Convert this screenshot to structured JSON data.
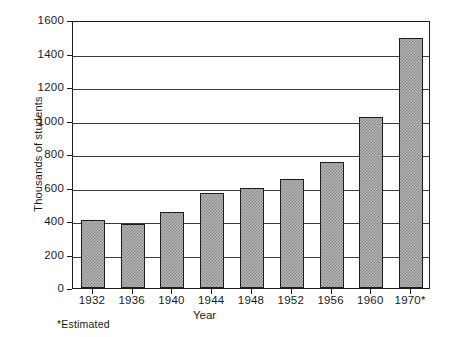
{
  "chart_data": {
    "type": "bar",
    "title": "",
    "subtitle": "",
    "xlabel": "Year",
    "ylabel": "Thousands of students",
    "categories": [
      "1932",
      "1936",
      "1940",
      "1944",
      "1948",
      "1952",
      "1956",
      "1960",
      "1970*"
    ],
    "values": [
      405,
      385,
      455,
      570,
      600,
      650,
      750,
      1020,
      1495
    ],
    "ylim": [
      0,
      1600
    ],
    "yticks": [
      0,
      200,
      400,
      600,
      800,
      1000,
      1200,
      1400,
      1600
    ],
    "ytick_labels": [
      "0",
      "200",
      "400",
      "600",
      "800",
      "1000",
      "1200",
      "1400",
      "1600"
    ],
    "grid": "horizontal",
    "legend": "none",
    "annotations": [
      "*Estimated"
    ],
    "bar_fill": "#b3b3b3",
    "bar_edge": "#1d1d1d",
    "axis_color": "#1d1d1d",
    "background": "#ffffff"
  },
  "figure": {
    "footnote": "*Estimated",
    "xaxis_title": "Year",
    "yaxis_title": "Thousands of students"
  }
}
